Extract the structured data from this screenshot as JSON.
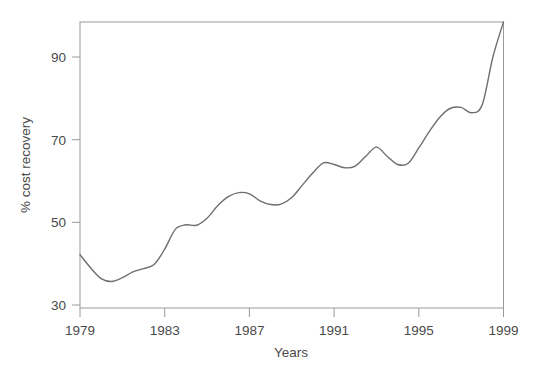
{
  "chart_data": {
    "type": "line",
    "title": "",
    "subtitle": "",
    "xlabel": "Years",
    "ylabel": "% cost recovery",
    "xlim": [
      1979,
      1999
    ],
    "ylim": [
      30,
      100
    ],
    "xticks": [
      1979,
      1983,
      1987,
      1991,
      1995,
      1999
    ],
    "xtick_labels": [
      "1979",
      "1983",
      "1987",
      "1991",
      "1995",
      "1999"
    ],
    "yticks": [
      30,
      50,
      70,
      90
    ],
    "ytick_labels": [
      "30",
      "50",
      "70",
      "90"
    ],
    "grid": false,
    "legend": null,
    "line_color": "#6e6e6e",
    "frame_color": "#9a9a9a",
    "series": [
      {
        "name": "% cost recovery",
        "x": [
          1979,
          1979.5,
          1980,
          1980.5,
          1981,
          1981.5,
          1982,
          1982.5,
          1983,
          1983.5,
          1984,
          1984.5,
          1985,
          1985.5,
          1986,
          1986.5,
          1987,
          1987.5,
          1988,
          1988.5,
          1989,
          1989.5,
          1990,
          1990.5,
          1991,
          1991.5,
          1992,
          1992.5,
          1993,
          1993.5,
          1994,
          1994.5,
          1995,
          1995.5,
          1996,
          1996.5,
          1997,
          1997.5,
          1998,
          1998.5,
          1999
        ],
        "values": [
          42.2,
          39.0,
          36.4,
          35.7,
          36.6,
          38.0,
          38.8,
          39.8,
          43.5,
          48.3,
          49.4,
          49.3,
          51.0,
          54.0,
          56.2,
          57.2,
          56.9,
          55.2,
          54.3,
          54.4,
          56.0,
          59.0,
          62.0,
          64.4,
          64.0,
          63.2,
          63.6,
          66.0,
          68.2,
          66.0,
          64.0,
          64.3,
          68.0,
          72.0,
          75.5,
          77.6,
          77.8,
          76.5,
          78.5,
          90.0,
          98.5
        ]
      }
    ],
    "annotations": []
  },
  "axes": {
    "x_axis_label": "Years",
    "y_axis_label": "% cost recovery"
  }
}
